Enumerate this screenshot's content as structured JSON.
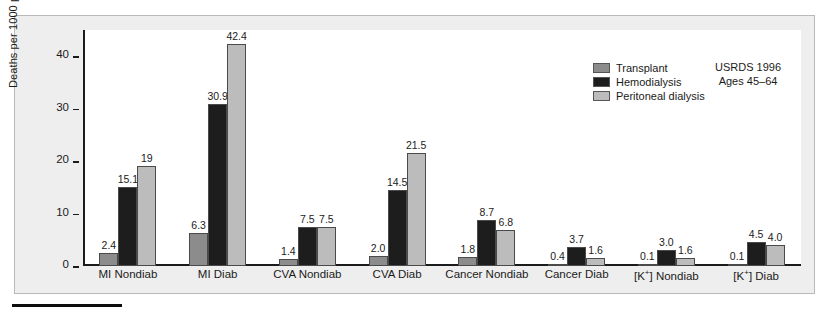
{
  "chart_data": {
    "type": "bar",
    "title": "",
    "xlabel": "",
    "ylabel": "Deaths per 1000 patient-years",
    "ylim": [
      0,
      45
    ],
    "yticks": [
      0,
      10,
      20,
      30,
      40
    ],
    "grid": false,
    "legend_position": "top-right-inside",
    "categories": [
      "MI Nondiab",
      "MI Diab",
      "CVA Nondiab",
      "CVA Diab",
      "Cancer Nondiab",
      "Cancer Diab",
      "[K+] Nondiab",
      "[K+] Diab"
    ],
    "category_labels_html": [
      "MI Nondiab",
      "MI Diab",
      "CVA Nondiab",
      "CVA Diab",
      "Cancer Nondiab",
      "Cancer Diab",
      "[K⁺] Nondiab",
      "[K⁺] Diab"
    ],
    "series": [
      {
        "name": "Transplant",
        "color": "#8c8c8c",
        "values": [
          2.4,
          6.3,
          1.4,
          2.0,
          1.8,
          0.4,
          0.1,
          0.1
        ],
        "labels": [
          "2.4",
          "6.3",
          "1.4",
          "2.0",
          "1.8",
          "0.4",
          "0.1",
          "0.1"
        ]
      },
      {
        "name": "Hemodialysis",
        "color": "#1d1d1d",
        "values": [
          15.1,
          30.9,
          7.5,
          14.5,
          8.7,
          3.7,
          3.0,
          4.5
        ],
        "labels": [
          "15.1",
          "30.9",
          "7.5",
          "14.5",
          "8.7",
          "3.7",
          "3.0",
          "4.5"
        ]
      },
      {
        "name": "Peritoneal dialysis",
        "color": "#bcbcbc",
        "values": [
          19.0,
          42.4,
          7.5,
          21.5,
          6.8,
          1.6,
          1.6,
          4.0
        ],
        "labels": [
          "19",
          "42.4",
          "7.5",
          "21.5",
          "6.8",
          "1.6",
          "1.6",
          "4.0"
        ]
      }
    ],
    "annotations": [
      "USRDS 1996",
      "Ages 45–64"
    ]
  },
  "axis": {
    "y_title": "Deaths per 1000 patient-years",
    "y_tick_labels": [
      "40",
      "30",
      "20",
      "10",
      "0"
    ]
  },
  "legend": {
    "items": [
      {
        "label": "Transplant",
        "color": "#8c8c8c"
      },
      {
        "label": "Hemodialysis",
        "color": "#1d1d1d"
      },
      {
        "label": "Peritoneal dialysis",
        "color": "#bcbcbc"
      }
    ]
  },
  "source_note": {
    "line1": "USRDS 1996",
    "line2": "Ages 45–64"
  }
}
